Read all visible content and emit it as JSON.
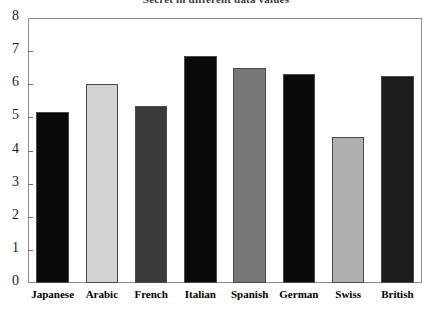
{
  "chart_data": {
    "type": "bar",
    "title": "Secret in different data values",
    "categories": [
      "Japanese",
      "Arabic",
      "French",
      "Italian",
      "Spanish",
      "German",
      "Swiss",
      "British"
    ],
    "values": [
      5.15,
      6.0,
      5.35,
      6.85,
      6.5,
      6.3,
      4.4,
      6.25
    ],
    "bar_colors": [
      "#0a0a0a",
      "#d2d2d2",
      "#3a3a3a",
      "#0a0a0a",
      "#787878",
      "#0a0a0a",
      "#b0b0b0",
      "#1d1d1d"
    ],
    "xlabel": "",
    "ylabel": "",
    "ylim": [
      0,
      8
    ],
    "ytick_labels": [
      "8",
      "7",
      "6",
      "5",
      "4",
      "3",
      "2",
      "1",
      "0"
    ],
    "ytick_values": [
      8,
      7,
      6,
      5,
      4,
      3,
      2,
      1,
      0
    ],
    "grid": false,
    "legend": false,
    "frame_color": "#8d8d8d",
    "background": "#ffffff"
  }
}
